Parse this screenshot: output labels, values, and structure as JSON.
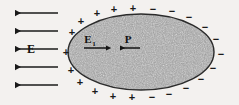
{
  "figure": {
    "background_color": "#f3f1ef",
    "ink_color": "#1a1a1a",
    "body_fill_color": "#9a9a9a",
    "body_outline_color": "#2b2b2b"
  },
  "labels": {
    "external_field": "E",
    "internal_field": "E",
    "internal_field_subscript": "1",
    "polarization": "P",
    "plus_sign": "+",
    "minus_sign": "−"
  },
  "external_field_arrows": [
    {
      "id": 1,
      "x1": 58,
      "y1": 13,
      "x2": 11,
      "y2": 13,
      "direction": "left"
    },
    {
      "id": 2,
      "x1": 58,
      "y1": 31,
      "x2": 11,
      "y2": 31,
      "direction": "left"
    },
    {
      "id": 3,
      "x1": 58,
      "y1": 49,
      "x2": 11,
      "y2": 49,
      "direction": "left"
    },
    {
      "id": 4,
      "x1": 58,
      "y1": 67,
      "x2": 11,
      "y2": 67,
      "direction": "left"
    },
    {
      "id": 5,
      "x1": 58,
      "y1": 85,
      "x2": 11,
      "y2": 85,
      "direction": "left"
    }
  ],
  "inner_arrows": [
    {
      "name": "internal-field-arrow",
      "x1": 84,
      "y1": 48,
      "x2": 110,
      "y2": 48,
      "direction": "right"
    },
    {
      "name": "polarization-arrow",
      "x1": 140,
      "y1": 48,
      "x2": 116,
      "y2": 48,
      "direction": "left"
    }
  ],
  "ellipse": {
    "cx": 141,
    "cy": 52,
    "rx": 73,
    "ry": 38
  },
  "positive_charges": [
    {
      "x": 97,
      "y": 13
    },
    {
      "x": 114,
      "y": 9
    },
    {
      "x": 133,
      "y": 8
    },
    {
      "x": 81,
      "y": 21
    },
    {
      "x": 72,
      "y": 32
    },
    {
      "x": 66,
      "y": 52
    },
    {
      "x": 71,
      "y": 70
    },
    {
      "x": 80,
      "y": 82
    },
    {
      "x": 95,
      "y": 91
    },
    {
      "x": 113,
      "y": 96
    },
    {
      "x": 132,
      "y": 97
    }
  ],
  "negative_charges": [
    {
      "x": 153,
      "y": 9
    },
    {
      "x": 172,
      "y": 11
    },
    {
      "x": 189,
      "y": 17
    },
    {
      "x": 205,
      "y": 27
    },
    {
      "x": 216,
      "y": 39
    },
    {
      "x": 220,
      "y": 54
    },
    {
      "x": 213,
      "y": 68
    },
    {
      "x": 201,
      "y": 79
    },
    {
      "x": 186,
      "y": 88
    },
    {
      "x": 169,
      "y": 94
    },
    {
      "x": 152,
      "y": 97
    }
  ],
  "annotations": {
    "external_field_label_position": {
      "x": 31,
      "y": 53
    },
    "internal_field_label_position": {
      "x": 86,
      "y": 42
    },
    "polarization_label_position": {
      "x": 126,
      "y": 42
    }
  }
}
